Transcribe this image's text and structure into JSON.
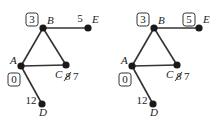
{
  "figures": [
    {
      "id": "left",
      "offset_x": 0,
      "nodes": [
        {
          "name": "A",
          "x": 21,
          "y": 66,
          "label_x": 10,
          "label_y": 64,
          "value": "0",
          "boxed": true,
          "value_x": 14,
          "value_y": 83
        },
        {
          "name": "B",
          "x": 43,
          "y": 28,
          "label_x": 47,
          "label_y": 24,
          "value": "3",
          "boxed": true,
          "value_x": 32,
          "value_y": 23
        },
        {
          "name": "C",
          "x": 66,
          "y": 65,
          "label_x": 55,
          "label_y": 78,
          "value": "7",
          "struck_value": "8",
          "boxed": false,
          "value_x": 73,
          "value_y": 80
        },
        {
          "name": "D",
          "x": 42,
          "y": 104,
          "label_x": 39,
          "label_y": 116,
          "value": "12",
          "boxed": false,
          "value_x": 31,
          "value_y": 104
        },
        {
          "name": "E",
          "x": 88,
          "y": 28,
          "label_x": 92,
          "label_y": 23,
          "value": "5",
          "boxed": false,
          "value_x": 80,
          "value_y": 22
        }
      ]
    },
    {
      "id": "right",
      "offset_x": 111,
      "nodes": [
        {
          "name": "A",
          "x": 21,
          "y": 66,
          "label_x": 10,
          "label_y": 64,
          "value": "0",
          "boxed": true,
          "value_x": 14,
          "value_y": 83
        },
        {
          "name": "B",
          "x": 43,
          "y": 28,
          "label_x": 47,
          "label_y": 24,
          "value": "3",
          "boxed": true,
          "value_x": 32,
          "value_y": 23
        },
        {
          "name": "C",
          "x": 66,
          "y": 65,
          "label_x": 55,
          "label_y": 78,
          "value": "7",
          "struck_value": "8",
          "boxed": false,
          "value_x": 73,
          "value_y": 80
        },
        {
          "name": "D",
          "x": 42,
          "y": 104,
          "label_x": 39,
          "label_y": 116,
          "value": "12",
          "boxed": false,
          "value_x": 31,
          "value_y": 104
        },
        {
          "name": "E",
          "x": 88,
          "y": 28,
          "label_x": 92,
          "label_y": 23,
          "value": "5",
          "boxed": true,
          "value_x": 78,
          "value_y": 23
        }
      ]
    }
  ],
  "edges": [
    [
      "A",
      "B"
    ],
    [
      "B",
      "C"
    ],
    [
      "A",
      "C"
    ],
    [
      "B",
      "E"
    ],
    [
      "A",
      "D"
    ]
  ]
}
